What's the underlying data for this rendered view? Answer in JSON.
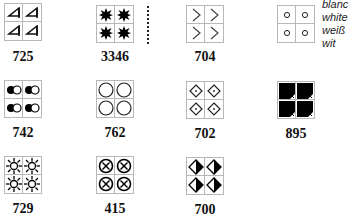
{
  "symbols": [
    {
      "code": "725",
      "icon": "triangle-flag-icon"
    },
    {
      "code": "3346",
      "icon": "black-star-icon"
    },
    {
      "code": "704",
      "icon": "chevron-right-icon"
    },
    {
      "code": "",
      "icon": "small-circle-icon"
    },
    {
      "code": "742",
      "icon": "black-white-dot-pair-icon"
    },
    {
      "code": "762",
      "icon": "large-circle-icon"
    },
    {
      "code": "702",
      "icon": "diamond-dot-icon"
    },
    {
      "code": "895",
      "icon": "black-square-notched-icon"
    },
    {
      "code": "729",
      "icon": "sun-outline-icon"
    },
    {
      "code": "415",
      "icon": "circled-x-icon"
    },
    {
      "code": "700",
      "icon": "half-filled-diamond-icon"
    }
  ],
  "legend": {
    "lines": [
      "blanc",
      "white",
      "weiß",
      "wit"
    ]
  }
}
